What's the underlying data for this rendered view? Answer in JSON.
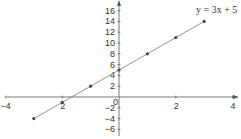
{
  "chart_data": {
    "type": "line",
    "title": "",
    "equation_label": "y = 3x + 5",
    "xlabel": "",
    "ylabel": "",
    "xlim": [
      -4,
      4
    ],
    "ylim": [
      -6,
      16
    ],
    "x_ticks": [
      -4,
      -2,
      0,
      2,
      4
    ],
    "y_ticks": [
      -6,
      -4,
      -2,
      0,
      2,
      4,
      6,
      8,
      10,
      12,
      14,
      16
    ],
    "grid": false,
    "series": [
      {
        "name": "y = 3x + 5",
        "x": [
          -3,
          -2,
          -1,
          0,
          1,
          2,
          3
        ],
        "y": [
          -4,
          -1,
          2,
          5,
          8,
          11,
          14
        ],
        "markers": true
      }
    ]
  },
  "labels": {
    "equation": "y = 3x + 5",
    "x_ticks": [
      "-4",
      "2",
      "0",
      "2",
      "4"
    ],
    "y_ticks": [
      "16",
      "14",
      "12",
      "10",
      "8",
      "6",
      "4",
      "2",
      "-2",
      "-4",
      "-6"
    ]
  },
  "colors": {
    "axis": "#555555",
    "line": "#888888",
    "marker": "#444444"
  }
}
